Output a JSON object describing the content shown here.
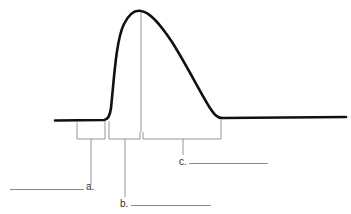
{
  "diagram": {
    "type": "waveform-with-labeled-intervals",
    "colors": {
      "curve": "#111111",
      "bracket": "#8a8a8a",
      "text": "#333333",
      "background": "#ffffff"
    },
    "curve": {
      "baseline_left": {
        "x1": 55,
        "y1": 120,
        "x2": 107,
        "y2": 120
      },
      "rise_start": {
        "x": 107,
        "y": 120
      },
      "peak": {
        "x": 141,
        "y": 11
      },
      "fall_end": {
        "x": 220,
        "y": 118
      },
      "baseline_right": {
        "x1": 220,
        "y1": 118,
        "x2": 346,
        "y2": 117
      }
    },
    "peak_marker": {
      "x": 141,
      "y_top": 11,
      "y_bottom": 132
    }
  },
  "labels": [
    {
      "id": "a",
      "text": "a.",
      "answer": ""
    },
    {
      "id": "b",
      "text": "b.",
      "answer": ""
    },
    {
      "id": "c",
      "text": "c.",
      "answer": ""
    }
  ],
  "brackets": [
    {
      "id": "a",
      "left": 77,
      "right": 105,
      "top": 121,
      "bottom": 139,
      "stem_x": 91,
      "stem_end_y": 186
    },
    {
      "id": "b",
      "left": 109,
      "right": 140,
      "top": 121,
      "bottom": 139,
      "stem_x": 125,
      "stem_end_y": 198
    },
    {
      "id": "c",
      "left": 143,
      "right": 221,
      "top": 121,
      "bottom": 139,
      "stem_x": 183,
      "stem_end_y": 156
    }
  ]
}
